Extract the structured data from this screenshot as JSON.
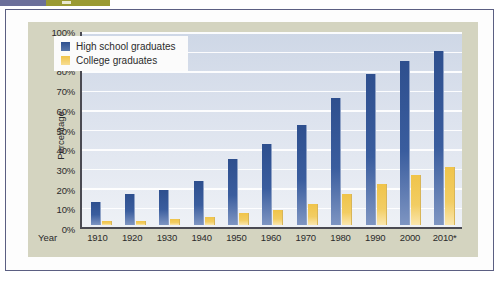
{
  "page": {
    "top_strip": {
      "left_color": "#6b6f9a",
      "right_color": "#9a9a33"
    },
    "panel_color": "#d4d4c0",
    "card_border_color": "#5b5f82"
  },
  "chart_data": {
    "type": "bar",
    "title": "",
    "xlabel": "Year",
    "ylabel": "Percentage",
    "categories": [
      "1910",
      "1920",
      "1930",
      "1940",
      "1950",
      "1960",
      "1970",
      "1980",
      "1990",
      "2000",
      "2010*"
    ],
    "series": [
      {
        "name": "High school graduates",
        "color": "#2e4f8e",
        "values": [
          12,
          16,
          18,
          23,
          34,
          42,
          52,
          66,
          78,
          85,
          90
        ]
      },
      {
        "name": "College graduates",
        "color": "#f0c44a",
        "values": [
          2,
          2,
          3,
          4,
          6,
          8,
          11,
          16,
          21,
          26,
          30
        ]
      }
    ],
    "ylim": [
      0,
      100
    ],
    "ytick_step": 10,
    "ytick_labels": [
      "100%",
      "90%",
      "80%",
      "70%",
      "60%",
      "50%",
      "40%",
      "30%",
      "20%",
      "10%",
      "0%"
    ],
    "ytick_values": [
      100,
      90,
      80,
      70,
      60,
      50,
      40,
      30,
      20,
      10,
      0
    ],
    "grid": true,
    "legend_position": "top-left",
    "footnote_marker": "*"
  }
}
